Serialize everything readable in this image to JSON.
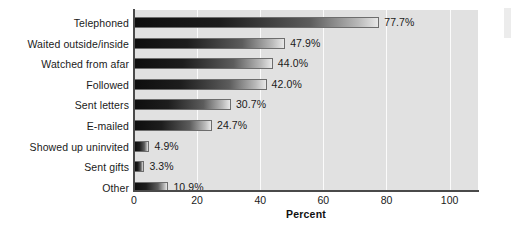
{
  "chart_data": {
    "type": "bar",
    "orientation": "horizontal",
    "title": "",
    "xlabel": "Percent",
    "ylabel": "",
    "xlim": [
      0,
      109
    ],
    "xticks": [
      0,
      20,
      40,
      60,
      80,
      100
    ],
    "xtick_labels": [
      "0",
      "20",
      "40",
      "60",
      "80",
      "100"
    ],
    "grid": "vertical-white-gridlines",
    "legend": "none",
    "categories": [
      "Telephoned",
      "Waited outside/inside",
      "Watched from afar",
      "Followed",
      "Sent letters",
      "E-mailed",
      "Showed up uninvited",
      "Sent gifts",
      "Other"
    ],
    "values": [
      77.7,
      47.9,
      44.0,
      42.0,
      30.7,
      24.7,
      4.9,
      3.3,
      10.9
    ],
    "value_labels": [
      "77.7%",
      "47.9%",
      "44.0%",
      "42.0%",
      "30.7%",
      "24.7%",
      "4.9%",
      "3.3%",
      "10.9%"
    ]
  },
  "colors": {
    "plot_background": "#e1e1e1",
    "page_background": "#ffffff",
    "gridline": "#fbfbfb",
    "axis": "#4a4a4a",
    "bar_dark": "#0e0e0e",
    "bar_light": "#e8e8e8",
    "bar_outline": "#6d6d6d",
    "text": "#1a1a1a"
  }
}
